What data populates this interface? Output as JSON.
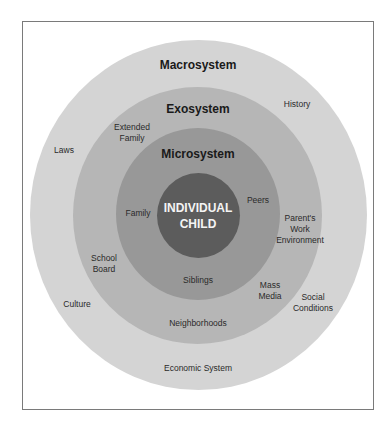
{
  "diagram": {
    "type": "concentric-circles",
    "colors": {
      "macrosystem": "#d4d4d4",
      "exosystem": "#b6b6b6",
      "microsystem": "#989898",
      "center": "#5c5c5c",
      "frame_border": "#7a7a7a"
    },
    "center": {
      "label": "INDIVIDUAL\nCHILD"
    },
    "layers": [
      {
        "title": "Microsystem",
        "items": [
          "Family",
          "Peers",
          "Siblings"
        ]
      },
      {
        "title": "Exosystem",
        "items": [
          "Extended\nFamily",
          "Parent's\nWork\nEnvironment",
          "School\nBoard",
          "Mass\nMedia",
          "Neighborhoods"
        ]
      },
      {
        "title": "Macrosystem",
        "items": [
          "History",
          "Laws",
          "Culture",
          "Social\nConditions",
          "Economic System"
        ]
      }
    ]
  }
}
